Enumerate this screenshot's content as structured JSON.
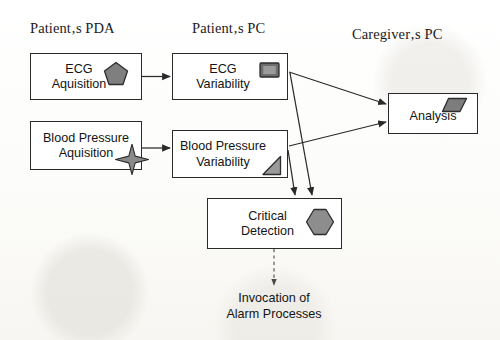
{
  "diagram": {
    "columns": [
      {
        "id": "pda",
        "label": "Patient‚s PDA"
      },
      {
        "id": "pc",
        "label": "Patient‚s PC"
      },
      {
        "id": "caregiver",
        "label": "Caregiver‚s PC"
      }
    ],
    "nodes": [
      {
        "id": "ecg-acquisition",
        "label": "ECG\nAquisition",
        "column": "pda",
        "icon": "pentagon-icon",
        "icon_fill": "#7f7f7f"
      },
      {
        "id": "blood-pressure-acquisition",
        "label": "Blood Pressure\nAquisition",
        "column": "pda",
        "icon": "four-point-star-icon",
        "icon_fill": "#8a8a8a"
      },
      {
        "id": "ecg-variability",
        "label": "ECG\nVariability",
        "column": "pc",
        "icon": "square-screen-icon",
        "icon_fill": "#6e6e6e"
      },
      {
        "id": "blood-pressure-variability",
        "label": "Blood Pressure\nVariability",
        "column": "pc",
        "icon": "right-triangle-icon",
        "icon_fill": "#9a9a9a"
      },
      {
        "id": "critical-detection",
        "label": "Critical\nDetection",
        "column": "pc",
        "icon": "hexagon-icon",
        "icon_fill": "#8d8d8d"
      },
      {
        "id": "analysis",
        "label": "Analysis",
        "column": "caregiver",
        "icon": "parallelogram-icon",
        "icon_fill": "#7d7d7d"
      }
    ],
    "annotations": [
      {
        "id": "invocation-note",
        "text": "Invocation of\nAlarm Processes"
      }
    ],
    "edges": [
      {
        "id": "edge-ecg-acq-to-ecg-var",
        "from": "ecg-acquisition",
        "to": "ecg-variability",
        "style": "solid"
      },
      {
        "id": "edge-bp-acq-to-bp-var",
        "from": "blood-pressure-acquisition",
        "to": "blood-pressure-variability",
        "style": "solid"
      },
      {
        "id": "edge-ecg-var-to-analysis",
        "from": "ecg-variability",
        "to": "analysis",
        "style": "solid"
      },
      {
        "id": "edge-bp-var-to-analysis",
        "from": "blood-pressure-variability",
        "to": "analysis",
        "style": "solid"
      },
      {
        "id": "edge-ecg-var-to-critical",
        "from": "ecg-variability",
        "to": "critical-detection",
        "style": "solid"
      },
      {
        "id": "edge-bp-var-to-critical",
        "from": "blood-pressure-variability",
        "to": "critical-detection",
        "style": "solid"
      },
      {
        "id": "edge-critical-to-invocation",
        "from": "critical-detection",
        "to": "invocation-note",
        "style": "dashed"
      }
    ],
    "colors": {
      "stroke": "#2a2a2a",
      "text": "#141414",
      "node_fill": "#ffffff",
      "background": "#fdfdfc"
    }
  }
}
